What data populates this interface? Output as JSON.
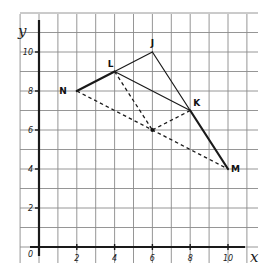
{
  "diagram": {
    "type": "coordinate-geometry-figure",
    "axes": {
      "x_label": "x",
      "y_label": "y",
      "origin_label": "0",
      "x_range": [
        0,
        11
      ],
      "y_range": [
        0,
        11
      ],
      "x_ticks": [
        2,
        4,
        6,
        8,
        10
      ],
      "y_ticks": [
        2,
        4,
        6,
        8,
        10
      ],
      "x_tick_labels": [
        "2",
        "4",
        "6",
        "8",
        "10"
      ],
      "y_tick_labels": [
        "2",
        "4",
        "6",
        "8",
        "10"
      ],
      "grid": true,
      "grid_step": 1
    },
    "points": [
      {
        "id": "N",
        "label": "N",
        "x": 2,
        "y": 8,
        "label_pos": "left"
      },
      {
        "id": "L",
        "label": "L",
        "x": 4,
        "y": 9,
        "label_pos": "above-left"
      },
      {
        "id": "J",
        "label": "J",
        "x": 6,
        "y": 10,
        "label_pos": "above"
      },
      {
        "id": "K",
        "label": "K",
        "x": 8,
        "y": 7,
        "label_pos": "above-right"
      },
      {
        "id": "M",
        "label": "M",
        "x": 10,
        "y": 4,
        "label_pos": "right"
      },
      {
        "id": "P",
        "label": "",
        "x": 6,
        "y": 6,
        "label_pos": "none",
        "marked": true
      }
    ],
    "segments": [
      {
        "from": "N",
        "to": "L",
        "style": "solid",
        "weight": "thick"
      },
      {
        "from": "L",
        "to": "J",
        "style": "solid",
        "weight": "normal"
      },
      {
        "from": "J",
        "to": "K",
        "style": "solid",
        "weight": "normal"
      },
      {
        "from": "K",
        "to": "M",
        "style": "solid",
        "weight": "thick"
      },
      {
        "from": "L",
        "to": "K",
        "style": "solid",
        "weight": "normal"
      },
      {
        "from": "N",
        "to": "M",
        "style": "dashed",
        "weight": "normal"
      },
      {
        "from": "L",
        "to": "P",
        "style": "dashed",
        "weight": "normal"
      },
      {
        "from": "K",
        "to": "P",
        "style": "dashed",
        "weight": "normal"
      }
    ]
  }
}
